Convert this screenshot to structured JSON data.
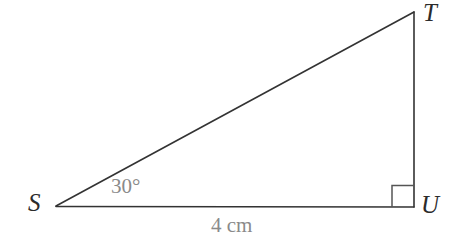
{
  "figure": {
    "type": "geometry-diagram",
    "shape": "right-triangle",
    "background_color": "#ffffff",
    "stroke_color": "#333333",
    "label_color": "#2b2b2b",
    "annotation_color": "#8a8a8a"
  },
  "vertices": {
    "S": {
      "label": "S",
      "x": 56,
      "y": 206
    },
    "T": {
      "label": "T",
      "x": 414,
      "y": 12
    },
    "U": {
      "label": "U",
      "x": 414,
      "y": 207
    }
  },
  "annotations": {
    "angle_at_S": "30°",
    "side_SU_length": "4 cm",
    "right_angle_at_U": "right-angle-marker"
  },
  "sides": {
    "SU": "4 cm",
    "ST": "",
    "TU": ""
  },
  "angles": {
    "S": "30°",
    "U": "90°",
    "T": ""
  }
}
